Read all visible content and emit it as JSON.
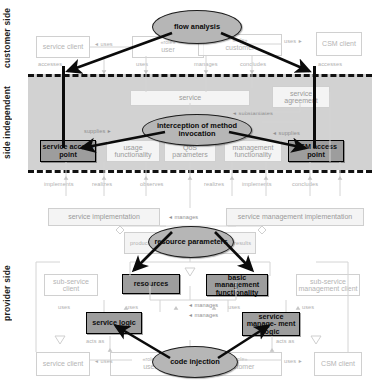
{
  "diagram": {
    "bands": [
      {
        "id": "customer",
        "label": "customer side"
      },
      {
        "id": "independent",
        "label": "side independent"
      },
      {
        "id": "provider",
        "label": "provider side"
      }
    ],
    "aspects": [
      {
        "id": "flow-analysis",
        "label": "flow analysis"
      },
      {
        "id": "interception",
        "label": "interception of method invocation"
      },
      {
        "id": "resource-parameters",
        "label": "resource parameters"
      },
      {
        "id": "code-injection",
        "label": "code injection"
      }
    ],
    "nodes": {
      "service_client_top": "service client",
      "user_top": "user",
      "customer_top": "customer",
      "csm_client_top": "CSM client",
      "service": "service",
      "service_agreement": "service agreement",
      "service_access_point": "service access point",
      "usage_functionality": "usage functionality",
      "qos_parameters": "QoS parameters",
      "management_functionality": "management functionality",
      "csm_access_point": "CSM access point",
      "service_implementation": "service implementation",
      "service_management_implementation": "service management implementation",
      "provider": "provider",
      "sub_service_client": "sub-service client",
      "resources": "resources",
      "basic_management_functionality": "basic management functionality",
      "sub_service_management_client": "sub-service management client",
      "service_logic": "service logic",
      "service_management_logic": "service manage- ment logic",
      "service_client_bottom": "service client",
      "user_bottom": "user",
      "customer_bottom": "customer",
      "csm_client_bottom": "CSM client"
    },
    "stereotypes": {
      "user_top": "«role»",
      "customer_top": "«role»",
      "user_bottom": "«role»",
      "customer_bottom": "«role»"
    },
    "relations": {
      "uses_top_left": "uses",
      "uses_top_right": "uses",
      "accesses_left": "accesses",
      "uses_user": "uses",
      "manages": "manages",
      "concludes_top": "concludes",
      "accesses_right": "accesses",
      "substantiates": "substantiates",
      "supplies_left": "supplies",
      "supplies_right": "supplies",
      "implements_left": "implements",
      "realizes_left": "realizes",
      "observes": "observes",
      "realizes_right": "realizes",
      "implements_right": "implements",
      "concludes_bottom": "concludes",
      "manages_mid": "manages",
      "produces": "produces",
      "results": "results",
      "uses_sub_left": "uses",
      "uses_res": "uses",
      "manages_b1": "manages",
      "manages_b2": "manages",
      "uses_bm": "uses",
      "uses_sub_right": "uses",
      "acts_as_left": "acts as",
      "acts_as_right": "acts as",
      "uses_bottom_left": "uses",
      "uses_bottom_right": "uses"
    },
    "colors": {
      "band_independent": "#d2d2d2",
      "aspect_fill": "#b6b6b6",
      "highlight_fill": "#9d9d9d",
      "stroke": "#111111",
      "faint_text": "#b4b4b4"
    }
  }
}
